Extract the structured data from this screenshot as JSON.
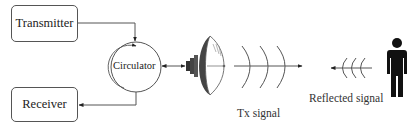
{
  "diagram": {
    "blocks": {
      "transmitter": "Transmitter",
      "receiver": "Receiver",
      "circulator": "Circulator"
    },
    "labels": {
      "tx_signal": "Tx signal",
      "reflected_signal": "Reflected signal"
    },
    "icons": {
      "antenna": "parabolic-dish-antenna-icon",
      "person": "person-silhouette-icon",
      "tx_waves": "outgoing-wavefronts-icon",
      "rx_waves": "incoming-wavefronts-icon"
    },
    "colors": {
      "line": "#555555",
      "fill": "#111111",
      "background": "#ffffff"
    }
  }
}
